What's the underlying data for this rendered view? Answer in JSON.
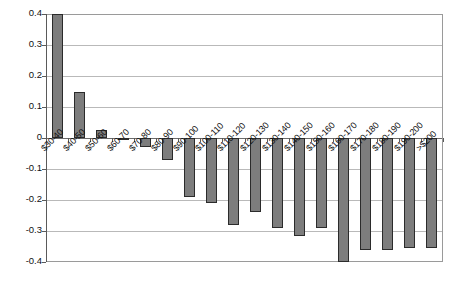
{
  "chart_data": {
    "type": "bar",
    "title": "",
    "subtitle": "",
    "xlabel": "",
    "ylabel": "",
    "grid": true,
    "legend": "none",
    "ylim": [
      -0.4,
      0.4
    ],
    "ytick_labels": [
      "0.4",
      "0.3",
      "0.2",
      "0.1",
      "0",
      "-0.1",
      "-0.2",
      "-0.3",
      "-0.4"
    ],
    "ytick_values": [
      0.4,
      0.3,
      0.2,
      0.1,
      0,
      -0.1,
      -0.2,
      -0.3,
      -0.4
    ],
    "categories": [
      "$30-40",
      "$40-50",
      "$50-60",
      "$60-70",
      "$70-80",
      "$80-90",
      "$90-100",
      "$100-110",
      "$110-120",
      "$120-130",
      "$130-140",
      "$140-150",
      "$150-160",
      "$160-170",
      "$170-180",
      "$180-190",
      "$190-200",
      ">$200"
    ],
    "values": [
      0.4,
      0.15,
      0.025,
      -0.005,
      -0.03,
      -0.07,
      -0.19,
      -0.21,
      -0.28,
      -0.24,
      -0.29,
      -0.315,
      -0.29,
      -0.4,
      -0.36,
      -0.36,
      -0.355,
      -0.355
    ],
    "bar_color": "#7d7d7d",
    "bar_border_color": "#2b2b2b",
    "grid_color": "#b9b9b9",
    "axis_color": "#5a5a5a",
    "plot_background": "#ffffff"
  }
}
